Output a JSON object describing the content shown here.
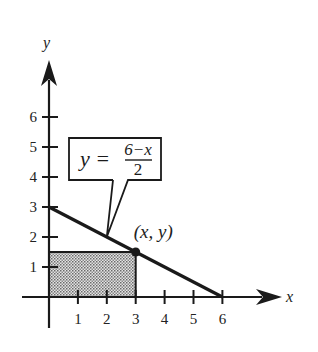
{
  "chart_data": {
    "type": "line",
    "title": "",
    "xlabel": "x",
    "ylabel": "y",
    "xlim": [
      0,
      7.3
    ],
    "ylim": [
      0,
      7.6
    ],
    "x_ticks": [
      "1",
      "2",
      "3",
      "4",
      "5",
      "6"
    ],
    "y_ticks": [
      "1",
      "2",
      "3",
      "4",
      "5",
      "6"
    ],
    "line": {
      "name": "y = (6 - x)/2",
      "points": [
        [
          0,
          3
        ],
        [
          6,
          0
        ]
      ]
    },
    "point": {
      "label": "(x, y)",
      "x": 3,
      "y": 1.5
    },
    "shaded_rectangle": {
      "x0": 0,
      "y0": 0,
      "x1": 3,
      "y1": 1.5,
      "fill": "dotted gray"
    },
    "callout": {
      "equation_lhs": "y =",
      "numerator": "6−x",
      "denominator": "2",
      "points_to": [
        2,
        2
      ]
    },
    "grid": false,
    "colors": {
      "ink": "#1a1a1a",
      "shade": "#9a9a9a"
    }
  }
}
